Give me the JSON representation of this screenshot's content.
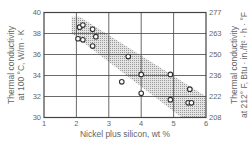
{
  "chart_data": {
    "type": "scatter",
    "title": "",
    "xlabel": "Nickel plus silicon, wt %",
    "ylabel": "Thermal conductivity at 100 °C, W/m · K",
    "ylabel_lines": [
      "Thermal conductivity",
      "at 100 °C, W/m · K"
    ],
    "y2label": "Thermal conductivity at 212° F, Btu · in./ft² · h · °F",
    "y2label_lines": [
      "Thermal conductivity",
      "at 212° F, Btu · in./ft² · h · °F"
    ],
    "xlim": [
      1,
      6
    ],
    "ylim": [
      30,
      40
    ],
    "xticks": [
      "1",
      "2",
      "3",
      "4",
      "5",
      "6"
    ],
    "yticks": [
      "30",
      "32",
      "34",
      "36",
      "38",
      "40"
    ],
    "y2ticks": [
      "208",
      "222",
      "236",
      "250",
      "263",
      "277"
    ],
    "grid": true,
    "legend": null,
    "series": [
      {
        "name": "measured",
        "marker": "open-circle",
        "points": [
          {
            "x": 2.1,
            "y": 38.6
          },
          {
            "x": 2.2,
            "y": 38.8
          },
          {
            "x": 2.5,
            "y": 38.4
          },
          {
            "x": 2.6,
            "y": 37.7
          },
          {
            "x": 2.05,
            "y": 37.5
          },
          {
            "x": 2.2,
            "y": 37.4
          },
          {
            "x": 2.5,
            "y": 36.8
          },
          {
            "x": 3.6,
            "y": 35.8
          },
          {
            "x": 4.0,
            "y": 34.1
          },
          {
            "x": 3.4,
            "y": 33.4
          },
          {
            "x": 4.0,
            "y": 32.3
          },
          {
            "x": 4.9,
            "y": 34.1
          },
          {
            "x": 5.5,
            "y": 32.7
          },
          {
            "x": 4.9,
            "y": 31.7
          },
          {
            "x": 5.45,
            "y": 31.4
          },
          {
            "x": 5.55,
            "y": 31.4
          }
        ]
      }
    ],
    "band": {
      "name": "scatter band",
      "fill": "stippled",
      "polygon": [
        [
          1.85,
          39.6
        ],
        [
          2.1,
          39.6
        ],
        [
          6.0,
          32.0
        ],
        [
          6.0,
          30.0
        ],
        [
          5.25,
          30.0
        ],
        [
          1.85,
          38.0
        ]
      ]
    }
  }
}
